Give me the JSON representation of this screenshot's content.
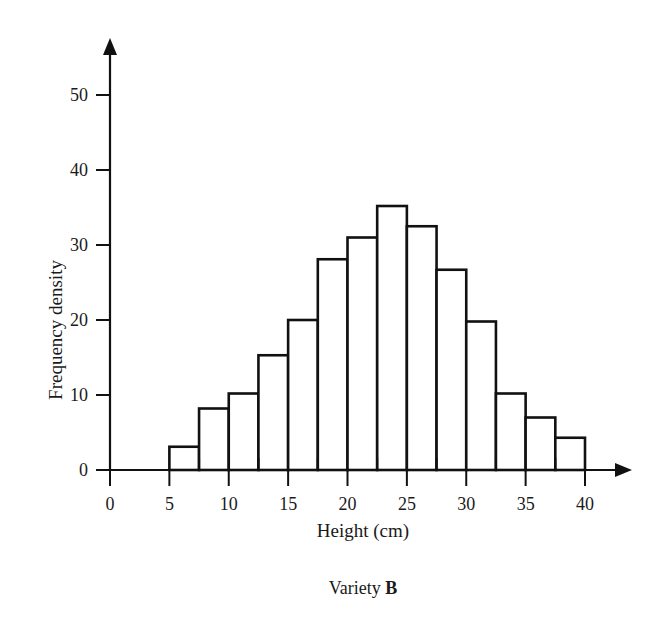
{
  "chart_data": {
    "type": "bar",
    "title": "",
    "caption": "Variety B",
    "caption_prefix": "Variety ",
    "caption_emphasis": "B",
    "xlabel": "Height (cm)",
    "ylabel": "Frequency density",
    "xlim": [
      0,
      40
    ],
    "ylim": [
      0,
      55
    ],
    "grid": false,
    "legend": "none",
    "bin_width": 2.5,
    "x_tick_labels": [
      "0",
      "5",
      "10",
      "15",
      "20",
      "25",
      "30",
      "35",
      "40"
    ],
    "x_tick_values": [
      0,
      5,
      10,
      15,
      20,
      25,
      30,
      35,
      40
    ],
    "x_minor_tick_values": [
      7.5,
      12.5,
      17.5,
      22.5,
      27.5,
      32.5,
      37.5
    ],
    "y_tick_labels": [
      "0",
      "10",
      "20",
      "30",
      "40",
      "50"
    ],
    "y_tick_values": [
      0,
      10,
      20,
      30,
      40,
      50
    ],
    "categories": [
      "5-7.5",
      "7.5-10",
      "10-12.5",
      "12.5-15",
      "15-17.5",
      "17.5-20",
      "20-22.5",
      "22.5-25",
      "25-27.5",
      "27.5-30",
      "30-32.5",
      "32.5-35",
      "35-37.5",
      "37.5-40"
    ],
    "bin_edges": [
      5,
      7.5,
      10,
      12.5,
      15,
      17.5,
      20,
      22.5,
      25,
      27.5,
      30,
      32.5,
      35,
      37.5,
      40
    ],
    "values": [
      3.1,
      8.2,
      10.2,
      15.3,
      20.0,
      28.1,
      31.0,
      35.2,
      32.5,
      26.7,
      19.8,
      10.2,
      7.0,
      4.3
    ]
  },
  "colors": {
    "ink": "#111111",
    "bar_fill": "#ffffff",
    "background": "#ffffff"
  }
}
